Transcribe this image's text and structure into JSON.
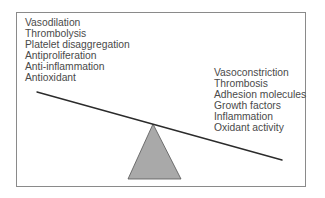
{
  "diagram": {
    "type": "balance-scale",
    "left_side": {
      "items": [
        "Vasodilation",
        "Thrombolysis",
        "Platelet disaggregation",
        "Antiproliferation",
        "Anti-inflammation",
        "Antioxidant"
      ]
    },
    "right_side": {
      "items": [
        "Vasoconstriction",
        "Thrombosis",
        "Adhesion molecules",
        "Growth factors",
        "Inflammation",
        "Oxidant activity"
      ]
    },
    "beam": {
      "tilt": "right-side-down",
      "color": "#2b2b2b"
    },
    "fulcrum": {
      "shape": "triangle",
      "fill": "#a9a9a9",
      "stroke": "#555555"
    },
    "frame_color": "#8a8a8a",
    "text_color": "#4a4a4a"
  }
}
